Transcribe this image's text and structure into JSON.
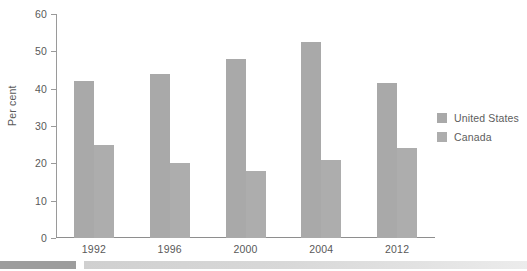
{
  "chart_data": {
    "type": "bar",
    "title": "",
    "subtitle": "",
    "xlabel": "",
    "ylabel": "Per cent",
    "categories": [
      "1992",
      "1996",
      "2000",
      "2004",
      "2012"
    ],
    "series": [
      {
        "name": "United States",
        "values": [
          42,
          44,
          48,
          52.5,
          41.5
        ],
        "color": "#a9a9a9"
      },
      {
        "name": "Canada",
        "values": [
          25,
          20,
          18,
          21,
          24
        ],
        "color": "#adadad"
      }
    ],
    "ylim": [
      0,
      60
    ],
    "yticks": [
      0,
      10,
      20,
      30,
      40,
      50,
      60
    ],
    "ytick_labels": [
      "0",
      "10",
      "20",
      "30",
      "40",
      "50",
      "60"
    ],
    "grid": false,
    "legend_position": "right",
    "legend_entries": [
      "United States",
      "Canada"
    ]
  },
  "axes": {
    "y_title": "Per cent",
    "y_labels": [
      "60",
      "50",
      "40",
      "30",
      "20",
      "10",
      "0"
    ],
    "x_labels": [
      "1992",
      "1996",
      "2000",
      "2004",
      "2012"
    ]
  },
  "legend": {
    "items": [
      {
        "label": "United States",
        "color": "#a9a9a9"
      },
      {
        "label": "Canada",
        "color": "#adadad"
      }
    ]
  },
  "colors": {
    "bar_united_states": "#a9a9a9",
    "bar_canada": "#adadad",
    "axis": "#9a9a9a",
    "text": "#595959",
    "strip_dark": "#9d9d9d",
    "strip_light": "#d8d8d8"
  }
}
